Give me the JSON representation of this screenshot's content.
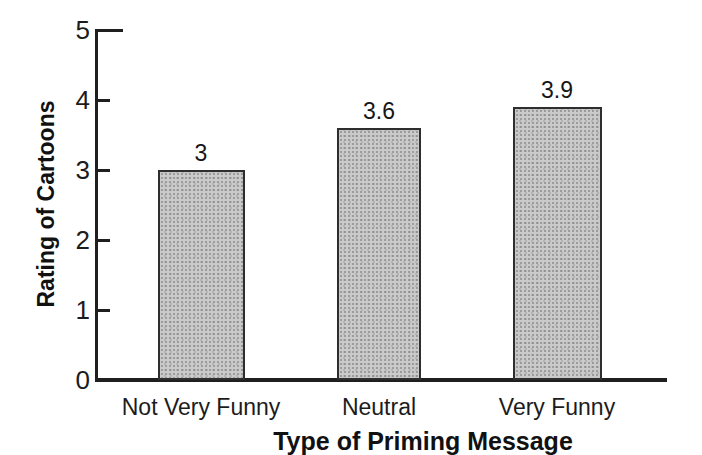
{
  "chart_data": {
    "type": "bar",
    "title": "",
    "xlabel": "Type of Priming Message",
    "ylabel": "Rating of Cartoons",
    "categories": [
      "Not Very Funny",
      "Neutral",
      "Very Funny"
    ],
    "values": [
      3,
      3.6,
      3.9
    ],
    "value_labels": [
      "3",
      "3.6",
      "3.9"
    ],
    "ylim": [
      0,
      5
    ],
    "yticks": [
      0,
      1,
      2,
      3,
      4,
      5
    ],
    "ytick_labels": [
      "0",
      "1",
      "2",
      "3",
      "4",
      "5"
    ],
    "grid": false,
    "legend": "none",
    "colors": {
      "background": "#ffffff",
      "bar_fill": "#cacaca",
      "bar_border": "#2e2e2e",
      "axis": "#1f1f1f",
      "text": "#1c1c1c"
    }
  }
}
